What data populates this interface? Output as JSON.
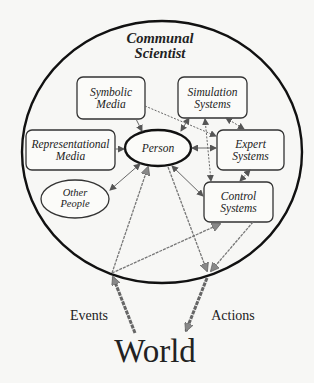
{
  "diagram": {
    "title_line1": "Communal",
    "title_line2": "Scientist",
    "nodes": {
      "symbolic_media": {
        "line1": "Symbolic",
        "line2": "Media"
      },
      "simulation_systems": {
        "line1": "Simulation",
        "line2": "Systems"
      },
      "representational_media": {
        "line1": "Representational",
        "line2": "Media"
      },
      "person": {
        "label": "Person"
      },
      "expert_systems": {
        "line1": "Expert",
        "line2": "Systems"
      },
      "other_people": {
        "line1": "Other",
        "line2": "People"
      },
      "control_systems": {
        "line1": "Control",
        "line2": "Systems"
      }
    },
    "external": {
      "events": "Events",
      "actions": "Actions",
      "world": "World"
    },
    "colors": {
      "outline": "#1a1a1a",
      "arrow": "#777777",
      "background": "#f7f7f5"
    }
  }
}
